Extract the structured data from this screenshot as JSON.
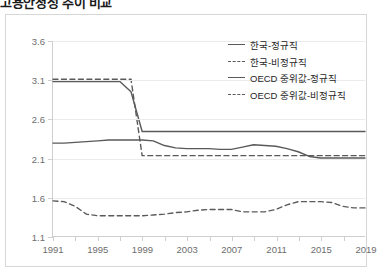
{
  "figure": {
    "title_clipped": "고용안정성 추이 비교",
    "border_color": "#d7d7d7",
    "axis_color": "#cfcfcf",
    "grid_color": "#ebebeb",
    "line_color": "#5a5a5a",
    "label_color": "#6d6d6d"
  },
  "legend": {
    "position": "top-right",
    "items": [
      {
        "label": "한국-정규직",
        "style": "solid",
        "swatch": "solid-line-swatch"
      },
      {
        "label": "한국-비정규직",
        "style": "dashed",
        "swatch": "dashed-line-swatch"
      },
      {
        "label": "OECD 중위값-정규직",
        "style": "solid",
        "swatch": "solid-line-swatch"
      },
      {
        "label": "OECD 중위값-비정규직",
        "style": "dashed",
        "swatch": "dashed-line-swatch"
      }
    ]
  },
  "chart_data": {
    "type": "line",
    "title": "고용안정성 추이 비교",
    "xlabel": "",
    "ylabel": "",
    "xlim": [
      1991,
      2019
    ],
    "ylim": [
      1.1,
      3.6
    ],
    "yticks": [
      "1.1",
      "1.6",
      "2.1",
      "2.6",
      "3.1",
      "3.6"
    ],
    "ytick_values": [
      1.1,
      1.6,
      2.1,
      2.6,
      3.1,
      3.6
    ],
    "xticks": [
      "1991",
      "1995",
      "1999",
      "2003",
      "2007",
      "2011",
      "2015",
      "2019"
    ],
    "xtick_values": [
      1991,
      1995,
      1999,
      2003,
      2007,
      2011,
      2015,
      2019
    ],
    "xtick_minor_step": 2,
    "grid": true,
    "legend_position": "top-right",
    "x": [
      1991,
      1992,
      1993,
      1994,
      1995,
      1996,
      1997,
      1998,
      1999,
      2000,
      2001,
      2002,
      2003,
      2004,
      2005,
      2006,
      2007,
      2008,
      2009,
      2010,
      2011,
      2012,
      2013,
      2014,
      2015,
      2016,
      2017,
      2018,
      2019
    ],
    "series": [
      {
        "name": "한국-정규직",
        "style": "solid",
        "values": [
          3.08,
          3.08,
          3.08,
          3.08,
          3.08,
          3.08,
          3.08,
          2.95,
          2.44,
          2.44,
          2.44,
          2.44,
          2.44,
          2.44,
          2.44,
          2.44,
          2.44,
          2.44,
          2.44,
          2.44,
          2.44,
          2.44,
          2.44,
          2.44,
          2.44,
          2.44,
          2.44,
          2.44,
          2.44
        ]
      },
      {
        "name": "한국-비정규직",
        "style": "dashed",
        "values": [
          3.11,
          3.11,
          3.11,
          3.11,
          3.11,
          3.11,
          3.11,
          3.11,
          2.13,
          2.13,
          2.13,
          2.13,
          2.13,
          2.13,
          2.13,
          2.13,
          2.13,
          2.13,
          2.13,
          2.13,
          2.13,
          2.13,
          2.13,
          2.13,
          2.13,
          2.13,
          2.13,
          2.13,
          2.13
        ]
      },
      {
        "name": "OECD 중위값-정규직",
        "style": "solid",
        "values": [
          2.29,
          2.29,
          2.3,
          2.31,
          2.32,
          2.33,
          2.33,
          2.33,
          2.33,
          2.32,
          2.26,
          2.23,
          2.22,
          2.22,
          2.22,
          2.21,
          2.21,
          2.24,
          2.27,
          2.26,
          2.25,
          2.22,
          2.18,
          2.12,
          2.1,
          2.1,
          2.1,
          2.1,
          2.1
        ]
      },
      {
        "name": "OECD 중위값-비정규직",
        "style": "dashed",
        "values": [
          1.55,
          1.54,
          1.48,
          1.38,
          1.36,
          1.36,
          1.36,
          1.36,
          1.36,
          1.37,
          1.38,
          1.4,
          1.41,
          1.43,
          1.44,
          1.44,
          1.44,
          1.41,
          1.41,
          1.41,
          1.44,
          1.5,
          1.54,
          1.54,
          1.54,
          1.53,
          1.48,
          1.46,
          1.46
        ]
      }
    ]
  }
}
